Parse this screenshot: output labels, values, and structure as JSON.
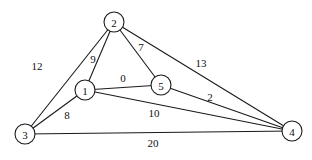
{
  "graph": {
    "node_radius": 10,
    "nodes": [
      {
        "id": "1",
        "label": "1",
        "x": 85,
        "y": 90
      },
      {
        "id": "2",
        "label": "2",
        "x": 114,
        "y": 22
      },
      {
        "id": "3",
        "label": "3",
        "x": 25,
        "y": 134
      },
      {
        "id": "4",
        "label": "4",
        "x": 292,
        "y": 131
      },
      {
        "id": "5",
        "label": "5",
        "x": 161,
        "y": 85
      }
    ],
    "edges": [
      {
        "from": "2",
        "to": "3",
        "weight": "12",
        "lx": 37,
        "ly": 66
      },
      {
        "from": "2",
        "to": "1",
        "weight": "9",
        "lx": 93,
        "ly": 59
      },
      {
        "from": "2",
        "to": "5",
        "weight": "7",
        "lx": 141,
        "ly": 47
      },
      {
        "from": "2",
        "to": "4",
        "weight": "13",
        "lx": 201,
        "ly": 63
      },
      {
        "from": "1",
        "to": "5",
        "weight": "0",
        "lx": 123,
        "ly": 78
      },
      {
        "from": "1",
        "to": "3",
        "weight": "8",
        "lx": 67,
        "ly": 115
      },
      {
        "from": "1",
        "to": "4",
        "weight": "10",
        "lx": 154,
        "ly": 113
      },
      {
        "from": "5",
        "to": "4",
        "weight": "2",
        "lx": 210,
        "ly": 97
      },
      {
        "from": "3",
        "to": "4",
        "weight": "20",
        "lx": 153,
        "ly": 143
      }
    ]
  }
}
